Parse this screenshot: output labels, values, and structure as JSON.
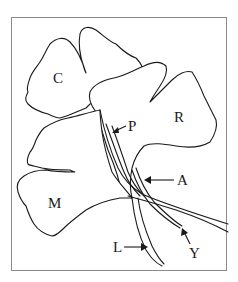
{
  "figure": {
    "type": "botanical-line-drawing",
    "colors": {
      "line": "#1a1a1a",
      "frame": "#8a8a8a",
      "background": "#ffffff"
    }
  },
  "labels": {
    "C": "C",
    "R": "R",
    "M": "M",
    "P": "P",
    "A": "A",
    "L": "L",
    "Y": "Y"
  }
}
